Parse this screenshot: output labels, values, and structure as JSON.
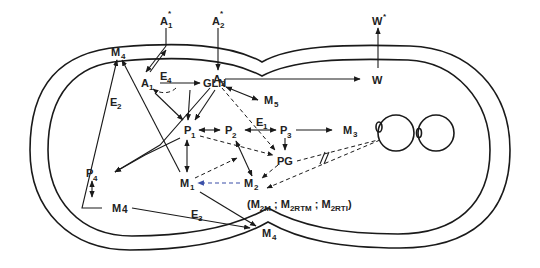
{
  "diagram": {
    "type": "cell-schematic",
    "nodes": {
      "A1_star": {
        "base": "A",
        "sub": "1",
        "sup": "*"
      },
      "A2_star": {
        "base": "A",
        "sub": "2",
        "sup": "*"
      },
      "W_star": {
        "base": "W",
        "sup": "*"
      },
      "W": {
        "base": "W"
      },
      "M4_top": {
        "base": "M",
        "sub": "4"
      },
      "A1": {
        "base": "A",
        "sub": "1"
      },
      "GLN": {
        "base": "GLN"
      },
      "A2": {
        "base": "A",
        "sub": "2"
      },
      "M5": {
        "base": "M",
        "sub": "5"
      },
      "P1": {
        "base": "P",
        "sub": "1"
      },
      "P2": {
        "base": "P",
        "sub": "2"
      },
      "P3": {
        "base": "P",
        "sub": "3"
      },
      "M3": {
        "base": "M",
        "sub": "3"
      },
      "PG": {
        "base": "PG"
      },
      "P4": {
        "base": "P",
        "sub": "4"
      },
      "M1": {
        "base": "M",
        "sub": "1"
      },
      "M2": {
        "base": "M",
        "sub": "2"
      },
      "M4_left": {
        "base": "M",
        "sub": "4"
      },
      "M4_bottom": {
        "base": "M",
        "sub": "4"
      }
    },
    "enzymes": {
      "E1": {
        "base": "E",
        "sub": "1"
      },
      "E2": {
        "base": "E",
        "sub": "2"
      },
      "E3": {
        "base": "E",
        "sub": "3"
      },
      "E4": {
        "base": "E",
        "sub": "4"
      }
    },
    "annotation": {
      "open": "(M",
      "s1": "2M",
      "sep1": " ; M",
      "s2": "2RTM",
      "sep2": " ; M",
      "s3": "2RTI",
      "close": ")"
    },
    "break_mark": "//",
    "edges": [
      {
        "from": "A1_star",
        "to": "A1",
        "style": "solid",
        "bidirectional": true
      },
      {
        "from": "A2_star",
        "to": "A2",
        "style": "solid"
      },
      {
        "from": "W",
        "to": "W_star",
        "style": "solid"
      },
      {
        "from": "A2",
        "to": "W",
        "style": "solid"
      },
      {
        "from": "A1",
        "to": "GLN",
        "style": "solid",
        "label": "E4"
      },
      {
        "from": "GLN",
        "to": "A1",
        "style": "dashed"
      },
      {
        "from": "A2",
        "to": "M5",
        "style": "solid",
        "bidirectional": true
      },
      {
        "from": "A1",
        "to": "P1",
        "style": "solid"
      },
      {
        "from": "GLN",
        "to": "P1",
        "style": "solid"
      },
      {
        "from": "A2",
        "to": "P1",
        "style": "solid"
      },
      {
        "from": "A2",
        "to": "P4",
        "style": "solid"
      },
      {
        "from": "A2",
        "to": "PG",
        "style": "dashed"
      },
      {
        "from": "P1",
        "to": "P2",
        "style": "solid",
        "bidirectional": true
      },
      {
        "from": "P2",
        "to": "P3",
        "style": "solid",
        "bidirectional": true,
        "label": "E1"
      },
      {
        "from": "P3",
        "to": "M3",
        "style": "solid"
      },
      {
        "from": "P3",
        "to": "PG",
        "style": "solid"
      },
      {
        "from": "P1",
        "to": "PG",
        "style": "dashed"
      },
      {
        "from": "P1",
        "to": "P4",
        "style": "solid"
      },
      {
        "from": "P1",
        "to": "M1",
        "style": "solid",
        "bidirectional": true
      },
      {
        "from": "P1",
        "to": "M4_top",
        "style": "solid"
      },
      {
        "from": "P2",
        "to": "M2",
        "style": "solid",
        "bidirectional": true
      },
      {
        "from": "M1",
        "to": "P2",
        "style": "dashed"
      },
      {
        "from": "PG",
        "to": "M2",
        "style": "dashed"
      },
      {
        "from": "M2",
        "to": "M1",
        "style": "dashed",
        "color": "#3a4fa8"
      },
      {
        "from": "PG",
        "to": "nucleoid",
        "style": "dashed",
        "broken": true
      },
      {
        "from": "nucleoid",
        "to": "M2",
        "style": "dashed"
      },
      {
        "from": "P4",
        "to": "M4_left",
        "style": "solid",
        "bidirectional": true
      },
      {
        "from": "M4_left",
        "to": "M4_top",
        "style": "solid",
        "label": "E2"
      },
      {
        "from": "M4_left",
        "to": "M4_bottom",
        "style": "solid",
        "label": "E3"
      },
      {
        "from": "M1",
        "to": "M4_bottom",
        "style": "solid"
      }
    ]
  }
}
